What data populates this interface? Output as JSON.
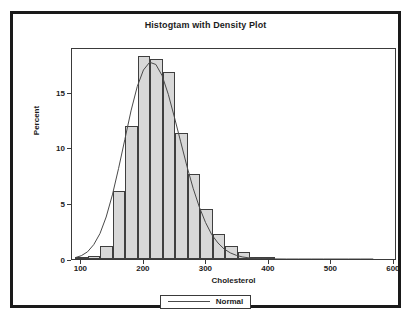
{
  "chart_data": {
    "type": "bar",
    "title": "Histogtam with Density Plot",
    "xlabel": "Cholesterol",
    "ylabel": "Percent",
    "xlim": [
      85,
      605
    ],
    "ylim": [
      0,
      19
    ],
    "xticks": [
      100,
      200,
      300,
      400,
      500,
      600
    ],
    "yticks": [
      0,
      5,
      10,
      15
    ],
    "grid": false,
    "bin_width": 20,
    "bin_starts": [
      90,
      110,
      130,
      150,
      170,
      190,
      210,
      230,
      250,
      270,
      290,
      310,
      330,
      350,
      370,
      390
    ],
    "categories": [
      "90-110",
      "110-130",
      "130-150",
      "150-170",
      "170-190",
      "190-210",
      "210-230",
      "230-250",
      "250-270",
      "270-290",
      "290-310",
      "310-330",
      "330-350",
      "350-370",
      "370-390",
      "390-410"
    ],
    "values": [
      0.15,
      0.25,
      1.2,
      6.1,
      11.9,
      18.2,
      17.9,
      16.8,
      11.3,
      7.6,
      4.5,
      2.2,
      1.2,
      0.6,
      0.15,
      0.05
    ],
    "bar_fill_color": "#d8d8d8",
    "bar_edge_color": "#3f3f3f",
    "series": [
      {
        "name": "Normal",
        "type": "line",
        "color": "#4a4a4a",
        "x": [
          90,
          100,
          110,
          120,
          130,
          140,
          150,
          160,
          170,
          180,
          190,
          200,
          210,
          220,
          230,
          240,
          250,
          260,
          270,
          280,
          290,
          300,
          310,
          320,
          330,
          340,
          350,
          360,
          370,
          380,
          390,
          400,
          410,
          430,
          450,
          470,
          490,
          510,
          530,
          550,
          570
        ],
        "y": [
          0.12,
          0.3,
          0.65,
          1.3,
          2.3,
          3.8,
          5.8,
          8.2,
          10.8,
          13.4,
          15.6,
          17.1,
          17.8,
          17.6,
          16.6,
          14.9,
          12.8,
          10.6,
          8.4,
          6.4,
          4.7,
          3.3,
          2.2,
          1.45,
          0.9,
          0.55,
          0.32,
          0.18,
          0.1,
          0.06,
          0.03,
          0.02,
          0.01,
          0.0,
          0.0,
          0.0,
          0.0,
          0.0,
          0.0,
          0.0,
          0.0
        ]
      }
    ],
    "legend": {
      "position": "bottom",
      "entries": [
        "Normal"
      ]
    }
  },
  "legend": {
    "normal_label": "Normal"
  }
}
